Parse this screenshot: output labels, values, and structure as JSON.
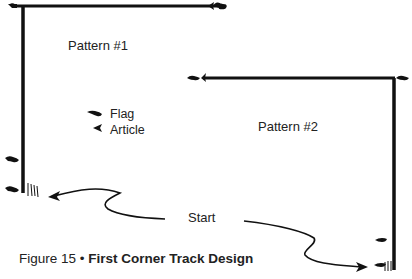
{
  "diagram": {
    "patterns": [
      {
        "id": "pattern-1",
        "label": "Pattern #1"
      },
      {
        "id": "pattern-2",
        "label": "Pattern #2"
      }
    ],
    "legend": {
      "flag": {
        "icon": "flag-icon",
        "label": "Flag"
      },
      "article": {
        "icon": "article-arrowhead-icon",
        "label": "Article"
      }
    },
    "start_label": "Start",
    "caption": {
      "prefix": "Figure 15",
      "separator": " • ",
      "title": "First Corner Track Design"
    },
    "colors": {
      "line": "#111111",
      "background": "#ffffff",
      "text": "#222222"
    }
  }
}
